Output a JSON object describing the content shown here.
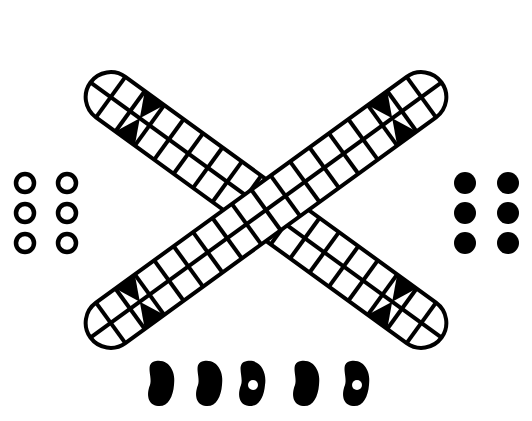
{
  "game": {
    "title": "Patolli cross board",
    "board": {
      "shape": "X-shaped cross of two rounded strips",
      "center": [
        266,
        210
      ],
      "strip_width": 50,
      "lanes_per_strip": 2,
      "cells_per_half_arm": 8,
      "cell_length": 24,
      "cap_radius": 25,
      "line_color": "#000000",
      "background_color": "#ffffff",
      "marked_cell_index_from_end": 2,
      "arms": [
        {
          "name": "upper-left",
          "angle_deg": 216
        },
        {
          "name": "upper-right",
          "angle_deg": 324
        },
        {
          "name": "lower-left",
          "angle_deg": 144
        },
        {
          "name": "lower-right",
          "angle_deg": 36
        }
      ]
    },
    "pieces": {
      "white_markers": {
        "label": "Player 1 markers (open rings)",
        "count": 6,
        "color": "#000000",
        "positions": [
          [
            25,
            183
          ],
          [
            67,
            183
          ],
          [
            25,
            213
          ],
          [
            67,
            213
          ],
          [
            25,
            243
          ],
          [
            67,
            243
          ]
        ]
      },
      "black_markers": {
        "label": "Player 2 markers (solid dots)",
        "count": 6,
        "color": "#000000",
        "positions": [
          [
            465,
            183
          ],
          [
            508,
            183
          ],
          [
            465,
            213
          ],
          [
            508,
            213
          ],
          [
            465,
            243
          ],
          [
            508,
            243
          ]
        ]
      }
    },
    "dice_beans": {
      "label": "Bean dice",
      "count": 5,
      "beans": [
        {
          "x": 160,
          "y": 383,
          "marked": false
        },
        {
          "x": 208,
          "y": 383,
          "marked": false
        },
        {
          "x": 251,
          "y": 383,
          "marked": true
        },
        {
          "x": 305,
          "y": 383,
          "marked": false
        },
        {
          "x": 355,
          "y": 383,
          "marked": true
        }
      ]
    }
  }
}
